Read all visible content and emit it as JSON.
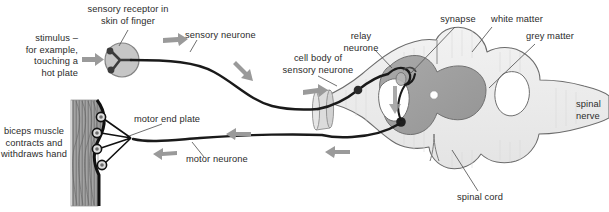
{
  "diagram": {
    "labels": {
      "stimulus": "stimulus –\nfor example,\ntouching a\nhot plate",
      "sensory_receptor": "sensory receptor in\nskin of finger",
      "sensory_neurone": "sensory neurone",
      "cell_body_sensory": "cell body of\nsensory neurone",
      "relay_neurone": "relay\nneurone",
      "synapse": "synapse",
      "white_matter": "white matter",
      "grey_matter": "grey matter",
      "spinal_nerve": "spinal\nnerve",
      "spinal_cord": "spinal cord",
      "motor_neurone": "motor neurone",
      "motor_end_plate": "motor end plate",
      "biceps": "biceps muscle\ncontracts and\nwithdraws hand"
    },
    "colors": {
      "text": "#2b2b2b",
      "neurone_stroke": "#1a1a1a",
      "leader_line": "#4a4a4a",
      "arrow_grey": "#9a9a9a",
      "white_matter": "#ececec",
      "grey_matter": "#a0a0a0",
      "cord_outline": "#5c5c5c",
      "muscle_fill": "#9d9d9d",
      "muscle_edge": "#111111",
      "receptor_fill": "#b9b9b9",
      "receptor_stroke": "#6e6e6e",
      "sheath_fill": "#d8d8d8",
      "background": "#ffffff"
    },
    "structures": [
      {
        "name": "sensory-receptor",
        "shape": "circle-with-branched-dendrites"
      },
      {
        "name": "sensory-neurone-axon",
        "shape": "curved-line"
      },
      {
        "name": "cell-body-sensory-neurone",
        "shape": "filled-dot"
      },
      {
        "name": "relay-neurone",
        "shape": "short-curve"
      },
      {
        "name": "synapse",
        "shape": "bouton"
      },
      {
        "name": "motor-neurone-axon",
        "shape": "long-line"
      },
      {
        "name": "motor-end-plate",
        "shape": "four-ringed-circles"
      },
      {
        "name": "biceps-muscle",
        "shape": "striated-band"
      },
      {
        "name": "spinal-cord",
        "shape": "cross-section"
      },
      {
        "name": "grey-matter",
        "shape": "butterfly"
      },
      {
        "name": "white-matter",
        "shape": "outer-region"
      },
      {
        "name": "central-canal",
        "shape": "small-white-dot"
      },
      {
        "name": "spinal-nerve",
        "shape": "lateral-projection"
      }
    ],
    "flow_arrows": [
      {
        "name": "arrow-stimulus-to-receptor",
        "direction": "right"
      },
      {
        "name": "arrow-sensory-upper",
        "direction": "right"
      },
      {
        "name": "arrow-sensory-descending",
        "direction": "down-right"
      },
      {
        "name": "arrow-into-cord",
        "direction": "right"
      },
      {
        "name": "arrow-relay-down",
        "direction": "down"
      },
      {
        "name": "arrow-motor-out",
        "direction": "left"
      },
      {
        "name": "arrow-motor-mid",
        "direction": "left"
      },
      {
        "name": "arrow-motor-to-muscle",
        "direction": "left"
      }
    ]
  }
}
